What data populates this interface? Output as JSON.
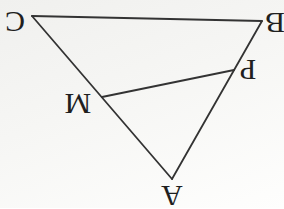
{
  "diagram": {
    "kind": "triangle-geometry-figure",
    "canvas": {
      "width": 284,
      "height": 208
    },
    "colors": {
      "line": "#333333",
      "label": "#1f1f1f",
      "background_top": "#f0f0ee",
      "background_bottom": "#fefefd"
    },
    "stroke_width": 1.8,
    "labels_rotation_deg": 180,
    "points": {
      "C": {
        "x": 32,
        "y": 16
      },
      "B": {
        "x": 262,
        "y": 21
      },
      "A": {
        "x": 172,
        "y": 179
      },
      "M": {
        "x": 102,
        "y": 97
      },
      "P": {
        "x": 234,
        "y": 70
      }
    },
    "points_on_sides": [
      {
        "name": "M",
        "on_side": "CA"
      },
      {
        "name": "P",
        "on_side": "BA"
      }
    ],
    "segments": [
      {
        "from": "C",
        "to": "B",
        "role": "triangle-side-CB"
      },
      {
        "from": "C",
        "to": "A",
        "role": "triangle-side-CA"
      },
      {
        "from": "B",
        "to": "A",
        "role": "triangle-side-BA"
      },
      {
        "from": "M",
        "to": "P",
        "role": "cevian-segment-MP"
      }
    ],
    "labels": [
      {
        "text": "C",
        "x": 15,
        "y": 22
      },
      {
        "text": "B",
        "x": 275,
        "y": 23
      },
      {
        "text": "A",
        "x": 172,
        "y": 196
      },
      {
        "text": "M",
        "x": 78,
        "y": 104
      },
      {
        "text": "P",
        "x": 248,
        "y": 70
      }
    ]
  }
}
